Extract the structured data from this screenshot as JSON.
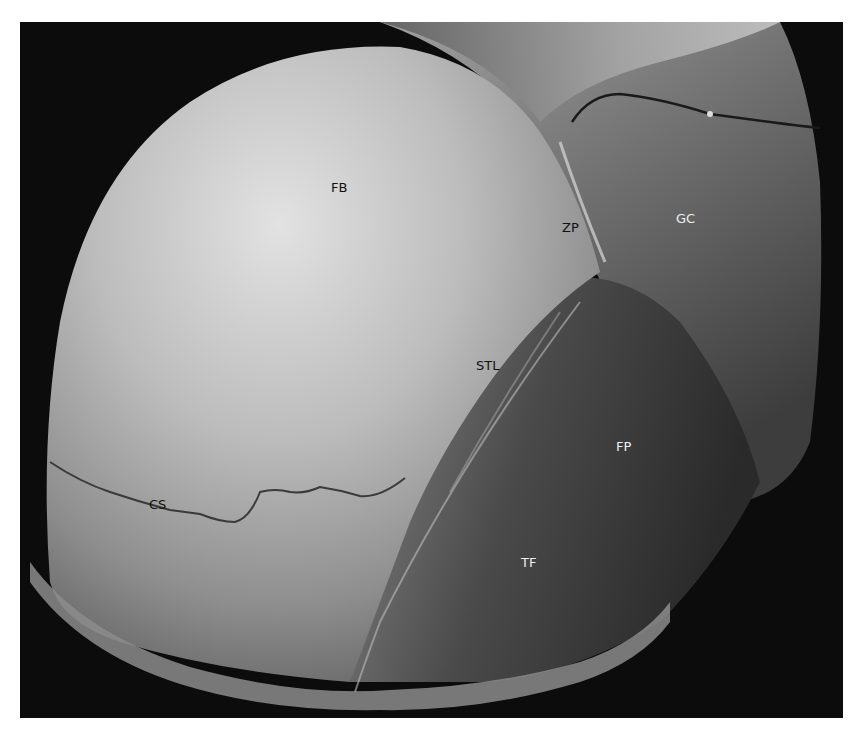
{
  "figure": {
    "background": "#ffffff",
    "photo_background": "#0c0c0c",
    "labels": [
      {
        "id": "FB",
        "text": "FB",
        "x": 331,
        "y": 181,
        "color": "dark"
      },
      {
        "id": "ZP",
        "text": "ZP",
        "x": 562,
        "y": 221,
        "color": "dark"
      },
      {
        "id": "GC",
        "text": "GC",
        "x": 676,
        "y": 212,
        "color": "light"
      },
      {
        "id": "STL",
        "text": "STL",
        "x": 476,
        "y": 359,
        "color": "dark"
      },
      {
        "id": "FP",
        "text": "FP",
        "x": 616,
        "y": 440,
        "color": "light"
      },
      {
        "id": "CS",
        "text": "CS",
        "x": 149,
        "y": 498,
        "color": "dark"
      },
      {
        "id": "TF",
        "text": "TF",
        "x": 521,
        "y": 556,
        "color": "light"
      }
    ]
  }
}
